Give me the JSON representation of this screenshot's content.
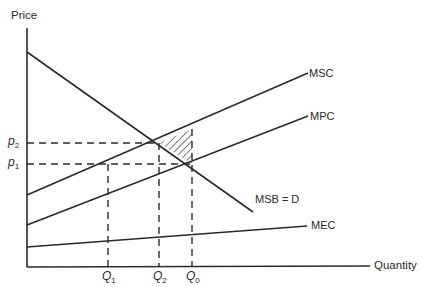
{
  "axes": {
    "y_label": "Price",
    "x_label": "Quantity"
  },
  "price_levels": [
    {
      "id": "p2",
      "symbol": "p",
      "subscript": "2"
    },
    {
      "id": "p1",
      "symbol": "p",
      "subscript": "1"
    }
  ],
  "quantity_levels": [
    {
      "id": "Q1",
      "symbol": "Q",
      "subscript": "1"
    },
    {
      "id": "Q2",
      "symbol": "Q",
      "subscript": "2"
    },
    {
      "id": "Q0",
      "symbol": "Q",
      "subscript": "0"
    }
  ],
  "curves": {
    "msc": "MSC",
    "mpc": "MPC",
    "msb": "MSB = D",
    "mec": "MEC"
  },
  "colors": {
    "line": "#2a2a2a",
    "background": "#ffffff"
  }
}
